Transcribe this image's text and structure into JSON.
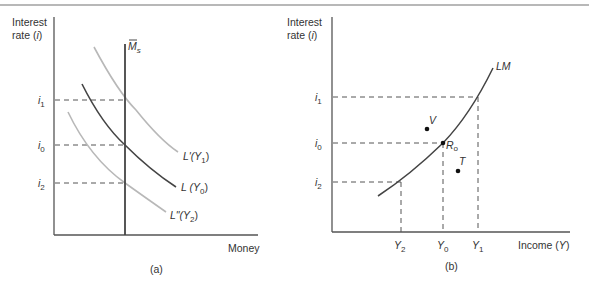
{
  "figure": {
    "top_rule": true,
    "panel_a": {
      "caption": "(a)",
      "y_axis_label_line1": "Interest",
      "y_axis_label_line2": "rate (",
      "y_axis_label_var": "i",
      "y_axis_label_close": ")",
      "x_axis_label": "Money",
      "money_supply_label": "M",
      "money_supply_sub": "s",
      "ticks": [
        {
          "base": "i",
          "sub": "1"
        },
        {
          "base": "i",
          "sub": "0"
        },
        {
          "base": "i",
          "sub": "2"
        }
      ],
      "curves": [
        {
          "label": "L'(Y",
          "sub": "1",
          "close": ")",
          "color": "#b8b8b8"
        },
        {
          "label": "L (Y",
          "sub": "0",
          "close": ")",
          "color": "#444444"
        },
        {
          "label": "L\"(Y",
          "sub": "2",
          "close": ")",
          "color": "#b8b8b8"
        }
      ]
    },
    "panel_b": {
      "caption": "(b)",
      "y_axis_label_line1": "Interest",
      "y_axis_label_line2": "rate (",
      "y_axis_label_var": "i",
      "y_axis_label_close": ")",
      "x_axis_label": "Income (",
      "x_axis_var": "Y",
      "x_axis_close": ")",
      "curve_label": "LM",
      "ticks_y": [
        {
          "base": "i",
          "sub": "1"
        },
        {
          "base": "i",
          "sub": "0"
        },
        {
          "base": "i",
          "sub": "2"
        }
      ],
      "ticks_x": [
        {
          "base": "Y",
          "sub": "2"
        },
        {
          "base": "Y",
          "sub": "0"
        },
        {
          "base": "Y",
          "sub": "1"
        }
      ],
      "points": [
        {
          "label": "V"
        },
        {
          "label": "R",
          "sub": "o"
        },
        {
          "label": "T"
        }
      ]
    },
    "colors": {
      "axis": "#555555",
      "dark_curve": "#444444",
      "light_curve": "#b8b8b8",
      "dash": "#555555",
      "rule": "#999999"
    }
  }
}
